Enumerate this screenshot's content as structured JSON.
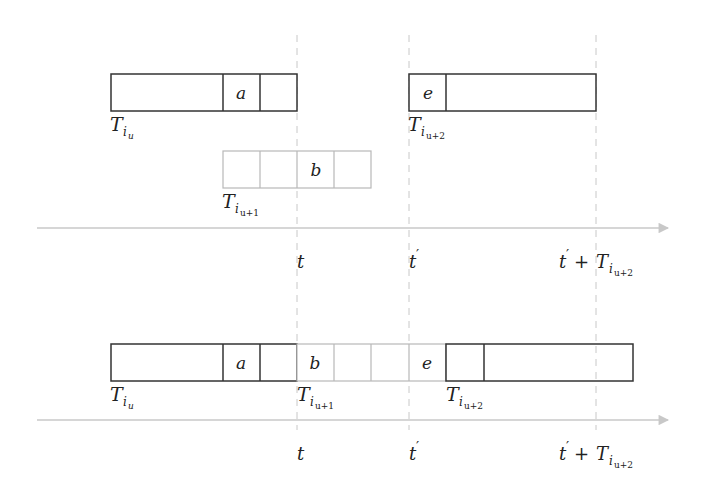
{
  "diagram": {
    "colors": {
      "dark_stroke": "#333333",
      "light_stroke": "#b8b8b8",
      "axis": "#c4c4c4",
      "dashed": "#c8c8c8",
      "text": "#222222"
    },
    "top_panel": {
      "task_iu": {
        "label_main": "T",
        "label_sub": "i",
        "label_subsub": "u",
        "cells": [
          "",
          "a",
          ""
        ]
      },
      "task_iu1": {
        "label_main": "T",
        "label_sub": "i",
        "label_subsub": "u+1",
        "cells": [
          "",
          "",
          "b",
          ""
        ]
      },
      "task_iu2": {
        "label_main": "T",
        "label_sub": "i",
        "label_subsub": "u+2",
        "cells": [
          "e",
          ""
        ]
      },
      "axis_ticks": [
        {
          "main": "t",
          "prime": ""
        },
        {
          "main": "t",
          "prime": "′"
        },
        {
          "main": "t",
          "prime": "′",
          "plus": " + T",
          "sub": "i",
          "subsub": "u+2"
        }
      ]
    },
    "bottom_panel": {
      "task_iu": {
        "label_main": "T",
        "label_sub": "i",
        "label_subsub": "u",
        "cells": [
          "",
          "a",
          ""
        ]
      },
      "task_iu1": {
        "label_main": "T",
        "label_sub": "i",
        "label_subsub": "u+1",
        "cells": [
          "b",
          "",
          "",
          "e"
        ]
      },
      "task_iu2": {
        "label_main": "T",
        "label_sub": "i",
        "label_subsub": "u+2",
        "cells": [
          "",
          ""
        ]
      },
      "axis_ticks": [
        {
          "main": "t",
          "prime": ""
        },
        {
          "main": "t",
          "prime": "′"
        },
        {
          "main": "t",
          "prime": "′",
          "plus": " + T",
          "sub": "i",
          "subsub": "u+2"
        }
      ]
    }
  }
}
